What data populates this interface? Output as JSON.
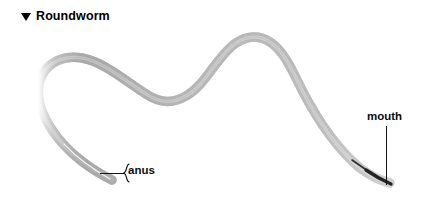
{
  "figure": {
    "caption": {
      "marker_icon": "triangle-down-icon",
      "text": "Roundworm"
    },
    "background_color": "#ffffff",
    "subject": {
      "name": "roundworm",
      "description": "photomicrograph of a nematode in a sinuous S-shaped pose",
      "body_color": "#808080",
      "body_dark_color": "#3a3a3a",
      "orientation": "head at lower right, tail at lower left"
    },
    "annotations": [
      {
        "id": "anus",
        "label": "anus",
        "leader": "horizontal-line-with-hook",
        "points_to": "tail end at lower left"
      },
      {
        "id": "mouth",
        "label": "mouth",
        "leader": "vertical-line",
        "points_to": "head tip at lower right"
      }
    ]
  }
}
